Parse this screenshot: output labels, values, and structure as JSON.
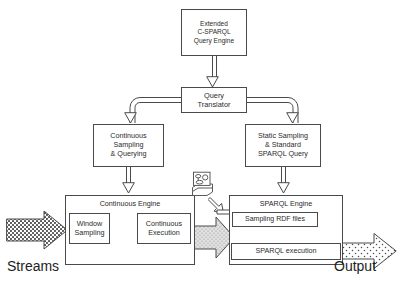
{
  "diagram": {
    "nodes": {
      "extended_engine": {
        "lines": [
          "Extended",
          "C-SPARQL",
          "Query Engine"
        ]
      },
      "query_translator": {
        "lines": [
          "Query",
          "Translator"
        ]
      },
      "continuous_sampling": {
        "lines": [
          "Continuous",
          "Sampling",
          "& Querying"
        ]
      },
      "static_sampling": {
        "lines": [
          "Static Sampling",
          "& Standard",
          "SPARQL Query"
        ]
      },
      "continuous_engine": {
        "title": "Continuous Engine"
      },
      "window_sampling": {
        "lines": [
          "Window",
          "Sampling"
        ]
      },
      "continuous_execution": {
        "lines": [
          "Continuous",
          "Execution"
        ]
      },
      "sparql_engine": {
        "title": "SPARQL Engine"
      },
      "sampling_rdf_files": {
        "title": "Sampling RDF files"
      },
      "sparql_execution": {
        "title": "SPARQL execution"
      }
    },
    "labels": {
      "streams": "Streams",
      "output": "Output"
    },
    "icons": {
      "database_stack": "database-stack-icon"
    },
    "colors": {
      "stroke": "#4a4a4a",
      "text": "#2b2b2b",
      "label_text": "#1d1d1d",
      "background": "#ffffff",
      "pattern_fill": "#d9d9d9"
    }
  }
}
